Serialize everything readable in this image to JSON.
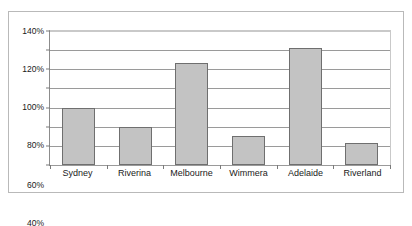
{
  "chart_data": {
    "type": "bar",
    "title": "",
    "xlabel": "",
    "ylabel": "",
    "categories": [
      "Sydney",
      "Riverina",
      "Melbourne",
      "Wimmera",
      "Adelaide",
      "Riverland"
    ],
    "values": [
      60,
      40,
      107,
      30,
      122,
      23
    ],
    "value_unit": "%",
    "ylim": [
      0,
      140
    ],
    "ytick_labels": [
      "140%",
      "120%",
      "100%",
      "80%",
      "60%",
      "40%",
      "20%",
      "0%"
    ],
    "ytick_values": [
      140,
      120,
      100,
      80,
      60,
      40,
      20,
      0
    ],
    "ytick_step": 20,
    "grid": true,
    "legend": false,
    "series": [
      {
        "name": "Series 1",
        "values": [
          60,
          40,
          107,
          30,
          122,
          23
        ]
      }
    ],
    "colors": {
      "bar_fill": "#c3c3c3",
      "bar_border": "#6f6f6f",
      "gridline": "#9a9a9a",
      "axis": "#8c8c8c",
      "frame": "#b9b9b9",
      "plot_background": "#ffffff",
      "text": "#1a1a1a"
    }
  }
}
